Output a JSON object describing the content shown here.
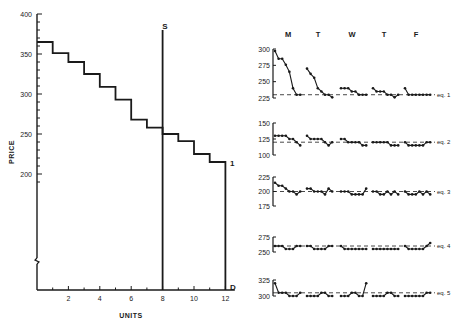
{
  "chart_data": [
    {
      "type": "line",
      "subtype": "step",
      "title": "",
      "xlabel": "UNITS",
      "ylabel": "PRICE",
      "xlim": [
        0,
        13
      ],
      "ylim": [
        150,
        400
      ],
      "y_axis_break": true,
      "x_ticks": [
        2,
        4,
        6,
        8,
        10,
        12
      ],
      "y_ticks": [
        200,
        250,
        300,
        350,
        400
      ],
      "grid": false,
      "series": [
        {
          "name": "Demand (D)",
          "label_top": "1",
          "label_bottom": "D",
          "style": "step",
          "steps": [
            {
              "from": 0,
              "to": 1,
              "price": 365
            },
            {
              "from": 1,
              "to": 2,
              "price": 351
            },
            {
              "from": 2,
              "to": 3,
              "price": 340
            },
            {
              "from": 3,
              "to": 4,
              "price": 325
            },
            {
              "from": 4,
              "to": 5,
              "price": 309
            },
            {
              "from": 5,
              "to": 6,
              "price": 293
            },
            {
              "from": 6,
              "to": 7,
              "price": 268
            },
            {
              "from": 7,
              "to": 8,
              "price": 258
            },
            {
              "from": 8,
              "to": 9,
              "price": 250
            },
            {
              "from": 9,
              "to": 10,
              "price": 241
            },
            {
              "from": 10,
              "to": 11,
              "price": 225
            },
            {
              "from": 11,
              "to": 12,
              "price": 215
            }
          ]
        },
        {
          "name": "Supply (S)",
          "label_top": "S",
          "style": "vertical",
          "x": 8,
          "price_top": 380
        }
      ]
    },
    {
      "type": "line",
      "title": "Price by session, Monday–Friday",
      "x_groups": [
        "M",
        "T",
        "W",
        "T",
        "F"
      ],
      "xlabel": "",
      "ylabel": "",
      "grid": false,
      "panels": [
        {
          "name": "eq. 1",
          "equilibrium": 230,
          "ylim": [
            225,
            300
          ],
          "y_ticks": [
            225,
            250,
            275,
            300
          ],
          "days": [
            [
              297,
              285,
              285,
              276,
              265,
              240,
              230,
              230
            ],
            [
              270,
              262,
              256,
              240,
              235,
              230,
              230,
              226
            ],
            [
              240,
              240,
              240,
              235,
              235,
              230,
              230,
              230
            ],
            [
              240,
              235,
              235,
              235,
              230,
              230,
              226,
              230
            ],
            [
              240,
              230,
              230,
              230,
              230,
              230,
              230,
              230
            ]
          ]
        },
        {
          "name": "eq. 2",
          "equilibrium": 120,
          "ylim": [
            100,
            150
          ],
          "y_ticks": [
            100,
            125,
            150
          ],
          "days": [
            [
              130,
              130,
              130,
              130,
              125,
              125,
              120,
              115
            ],
            [
              130,
              125,
              125,
              125,
              125,
              120,
              115,
              120
            ],
            [
              125,
              125,
              120,
              120,
              120,
              120,
              115,
              115
            ],
            [
              120,
              120,
              120,
              120,
              120,
              115,
              115,
              115
            ],
            [
              120,
              115,
              115,
              115,
              115,
              115,
              120,
              120
            ]
          ]
        },
        {
          "name": "eq. 3",
          "equilibrium": 200,
          "ylim": [
            175,
            225
          ],
          "y_ticks": [
            175,
            200,
            225
          ],
          "days": [
            [
              215,
              210,
              210,
              205,
              200,
              200,
              195,
              200
            ],
            [
              205,
              205,
              200,
              200,
              200,
              195,
              205,
              200
            ],
            [
              200,
              200,
              200,
              195,
              195,
              195,
              195,
              205
            ],
            [
              200,
              200,
              195,
              195,
              200,
              195,
              200,
              195
            ],
            [
              200,
              195,
              195,
              195,
              200,
              195,
              200,
              195
            ]
          ]
        },
        {
          "name": "eq. 4",
          "equilibrium": 260,
          "ylim": [
            250,
            275
          ],
          "y_ticks": [
            250,
            275
          ],
          "days": [
            [
              260,
              260,
              260,
              255,
              255,
              255,
              260,
              260
            ],
            [
              260,
              260,
              255,
              255,
              255,
              255,
              260,
              260
            ],
            [
              260,
              255,
              255,
              255,
              255,
              255,
              255,
              255
            ],
            [
              255,
              255,
              255,
              255,
              255,
              255,
              255,
              255
            ],
            [
              260,
              255,
              255,
              255,
              255,
              255,
              260,
              265
            ]
          ]
        },
        {
          "name": "eq. 5",
          "equilibrium": 305,
          "ylim": [
            300,
            325
          ],
          "y_ticks": [
            300,
            325
          ],
          "days": [
            [
              320,
              305,
              305,
              305,
              300,
              300,
              300,
              305
            ],
            [
              300,
              300,
              300,
              300,
              305,
              305,
              300,
              300
            ],
            [
              300,
              300,
              300,
              305,
              305,
              300,
              300,
              320
            ],
            [
              300,
              300,
              300,
              300,
              305,
              305,
              300,
              300
            ],
            [
              300,
              300,
              300,
              300,
              300,
              300,
              305,
              305
            ]
          ]
        }
      ]
    }
  ],
  "left_chart": {
    "ylabel": "PRICE",
    "xlabel": "UNITS",
    "supply_label": "S",
    "demand_label": "D",
    "curve_label": "1"
  },
  "right_chart": {
    "day_labels": [
      "M",
      "T",
      "W",
      "T",
      "F"
    ],
    "eq_labels": [
      "eq. 1",
      "eq. 2",
      "eq. 3",
      "eq. 4",
      "eq. 5"
    ]
  },
  "colors": {
    "ink": "#1a1a1a",
    "background": "#ffffff"
  }
}
